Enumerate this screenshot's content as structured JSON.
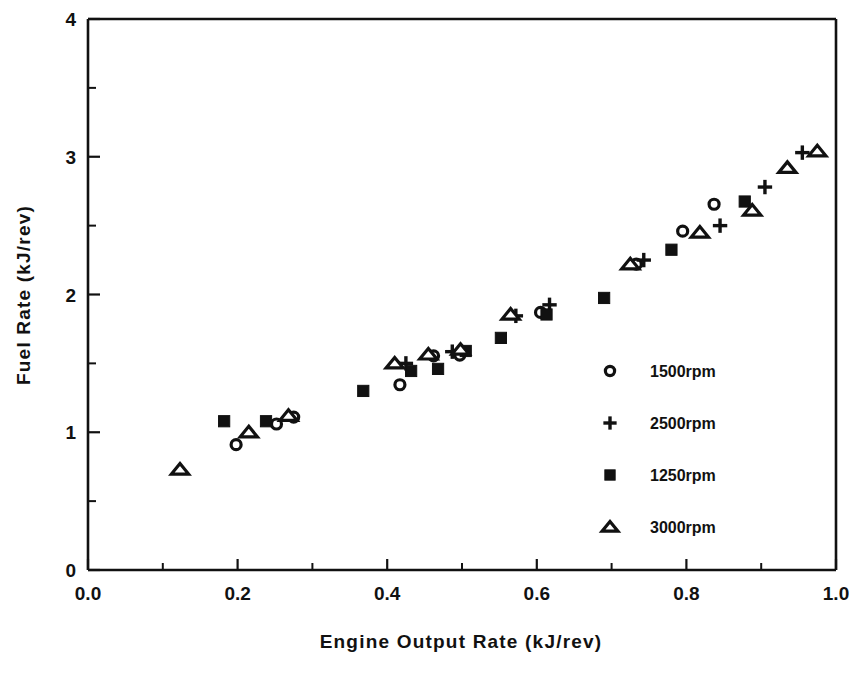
{
  "chart_data": {
    "type": "scatter",
    "title": "",
    "xlabel": "Engine Output Rate  (kJ/rev)",
    "ylabel": "Fuel  Rate  (kJ/rev)",
    "xlim": [
      0.0,
      1.0
    ],
    "ylim": [
      0.0,
      4.0
    ],
    "xticks": [
      "0.0",
      "0.2",
      "0.4",
      "0.6",
      "0.8",
      "1.0"
    ],
    "xtick_values": [
      0.0,
      0.2,
      0.4,
      0.6,
      0.8,
      1.0
    ],
    "yticks": [
      "0",
      "1",
      "2",
      "3",
      "4"
    ],
    "ytick_values": [
      0,
      1,
      2,
      3,
      4
    ],
    "x_minor_interval": 0.1,
    "y_minor_interval": 0.5,
    "grid": false,
    "legend_position": "center-right-inside",
    "series": [
      {
        "name": "1500rpm",
        "marker": "circle-open",
        "points": [
          [
            0.198,
            0.91
          ],
          [
            0.252,
            1.06
          ],
          [
            0.275,
            1.11
          ],
          [
            0.417,
            1.345
          ],
          [
            0.462,
            1.555
          ],
          [
            0.497,
            1.56
          ],
          [
            0.605,
            1.87
          ],
          [
            0.733,
            2.22
          ],
          [
            0.795,
            2.46
          ],
          [
            0.837,
            2.655
          ]
        ]
      },
      {
        "name": "2500rpm",
        "marker": "plus",
        "points": [
          [
            0.425,
            1.5
          ],
          [
            0.487,
            1.585
          ],
          [
            0.572,
            1.845
          ],
          [
            0.617,
            1.925
          ],
          [
            0.743,
            2.25
          ],
          [
            0.845,
            2.5
          ],
          [
            0.905,
            2.78
          ],
          [
            0.955,
            3.03
          ]
        ]
      },
      {
        "name": "1250rpm",
        "marker": "square-filled",
        "points": [
          [
            0.182,
            1.08
          ],
          [
            0.238,
            1.08
          ],
          [
            0.368,
            1.3
          ],
          [
            0.432,
            1.445
          ],
          [
            0.468,
            1.46
          ],
          [
            0.505,
            1.59
          ],
          [
            0.552,
            1.685
          ],
          [
            0.613,
            1.855
          ],
          [
            0.69,
            1.975
          ],
          [
            0.78,
            2.325
          ],
          [
            0.878,
            2.675
          ]
        ]
      },
      {
        "name": "3000rpm",
        "marker": "triangle-open",
        "points": [
          [
            0.123,
            0.73
          ],
          [
            0.215,
            1.0
          ],
          [
            0.268,
            1.12
          ],
          [
            0.41,
            1.5
          ],
          [
            0.455,
            1.565
          ],
          [
            0.498,
            1.6
          ],
          [
            0.565,
            1.855
          ],
          [
            0.725,
            2.22
          ],
          [
            0.818,
            2.45
          ],
          [
            0.888,
            2.61
          ],
          [
            0.935,
            2.92
          ],
          [
            0.975,
            3.04
          ]
        ]
      }
    ]
  },
  "legend": {
    "entries": [
      {
        "label": "1500rpm",
        "marker": "circle-open"
      },
      {
        "label": "2500rpm",
        "marker": "plus"
      },
      {
        "label": "1250rpm",
        "marker": "square-filled"
      },
      {
        "label": "3000rpm",
        "marker": "triangle-open"
      }
    ]
  },
  "axes": {
    "x_title": "Engine Output Rate  (kJ/rev)",
    "y_title": "Fuel  Rate  (kJ/rev)"
  },
  "colors": {
    "ink": "#111111",
    "background": "#ffffff"
  }
}
